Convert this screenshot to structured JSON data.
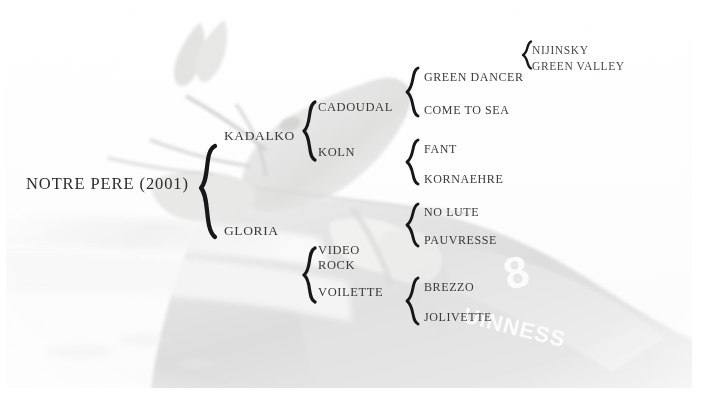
{
  "figure": {
    "type": "pedigree-chart",
    "subject": "NOTRE PERE (2001)",
    "background_photo": {
      "description": "faded photograph of a racehorse head and jockey",
      "saddle_cloth_number": "8",
      "sponsor_text": "GUINNESS"
    }
  },
  "colors": {
    "text": "#3b3a38",
    "brace": "#17161a",
    "background": "#ffffff"
  },
  "pedigree": {
    "generation_0": [
      {
        "id": "notre-pere",
        "label": "NOTRE PERE (2001)"
      }
    ],
    "generation_1": [
      {
        "id": "kadalko",
        "label": "KADALKO"
      },
      {
        "id": "gloria",
        "label": "GLORIA"
      }
    ],
    "generation_2": [
      {
        "id": "cadoudal",
        "label": "CADOUDAL"
      },
      {
        "id": "koln",
        "label": "KOLN"
      },
      {
        "id": "video-rock",
        "label_line1": "VIDEO",
        "label_line2": "ROCK"
      },
      {
        "id": "voilette",
        "label": "VOILETTE"
      }
    ],
    "generation_3": [
      {
        "id": "green-dancer",
        "label": "GREEN DANCER"
      },
      {
        "id": "come-to-sea",
        "label": "COME TO SEA"
      },
      {
        "id": "fant",
        "label": "FANT"
      },
      {
        "id": "kornaehre",
        "label": "KORNAEHRE"
      },
      {
        "id": "no-lute",
        "label": "NO LUTE"
      },
      {
        "id": "pauvresse",
        "label": "PAUVRESSE"
      },
      {
        "id": "brezzo",
        "label": "BREZZO"
      },
      {
        "id": "jolivette",
        "label": "JOLIVETTE"
      }
    ],
    "generation_4": [
      {
        "id": "nijinsky",
        "label": "NIJINSKY"
      },
      {
        "id": "green-valley",
        "label": "GREEN VALLEY"
      }
    ]
  }
}
